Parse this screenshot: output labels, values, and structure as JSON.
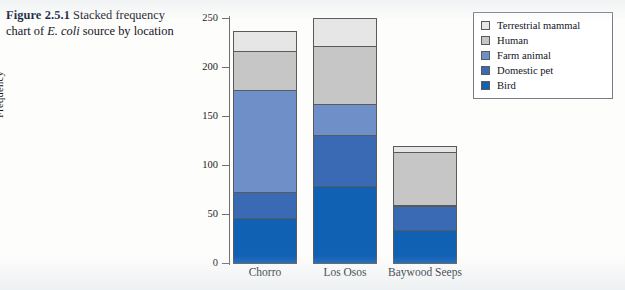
{
  "caption": {
    "figure_number": "Figure 2.5.1",
    "text_before_italic": "Stacked frequency chart of ",
    "italic_text": "E. coli",
    "text_after_italic": " source by location"
  },
  "legend": {
    "items": [
      {
        "label": "Terrestrial mammal",
        "color": "#e6e6e6",
        "swatch_name": "legend-swatch-terrestrial-mammal"
      },
      {
        "label": "Human",
        "color": "#c6c6c6",
        "swatch_name": "legend-swatch-human"
      },
      {
        "label": "Farm animal",
        "color": "#6f8fc8",
        "swatch_name": "legend-swatch-farm-animal"
      },
      {
        "label": "Domestic pet",
        "color": "#3b6ab5",
        "swatch_name": "legend-swatch-domestic-pet"
      },
      {
        "label": "Bird",
        "color": "#1060b4",
        "swatch_name": "legend-swatch-bird"
      }
    ]
  },
  "axes": {
    "ylabel": "Frequency",
    "yticks": [
      "250",
      "200",
      "150",
      "100",
      "50",
      "0"
    ],
    "xticklabels": [
      "Chorro",
      "Los Osos",
      "Baywood Seeps"
    ]
  },
  "chart_data": {
    "type": "bar",
    "subtype": "stacked-bar",
    "title": "Stacked frequency chart of E. coli source by location",
    "xlabel": "",
    "ylabel": "Frequency",
    "ylim": [
      0,
      250
    ],
    "ytick_values": [
      0,
      50,
      100,
      150,
      200,
      250
    ],
    "grid": false,
    "legend_position": "top-right",
    "categories": [
      "Chorro",
      "Los Osos",
      "Baywood Seeps"
    ],
    "stack_order_bottom_to_top": [
      "Bird",
      "Domestic pet",
      "Farm animal",
      "Human",
      "Terrestrial mammal"
    ],
    "series": [
      {
        "name": "Bird",
        "color": "#1060b4",
        "values": [
          47,
          80,
          35
        ]
      },
      {
        "name": "Domestic pet",
        "color": "#3b6ab5",
        "values": [
          28,
          53,
          25
        ]
      },
      {
        "name": "Farm animal",
        "color": "#6f8fc8",
        "values": [
          105,
          32,
          2
        ]
      },
      {
        "name": "Human",
        "color": "#c6c6c6",
        "values": [
          40,
          61,
          55
        ]
      },
      {
        "name": "Terrestrial mammal",
        "color": "#e6e6e6",
        "values": [
          22,
          29,
          7
        ]
      }
    ],
    "totals": [
      242,
      255,
      124
    ]
  },
  "geometry": {
    "baseline_y": 263,
    "px_per_unit": 0.98,
    "bar_width_px": 64,
    "bar_left_px": [
      233,
      313,
      393
    ]
  }
}
